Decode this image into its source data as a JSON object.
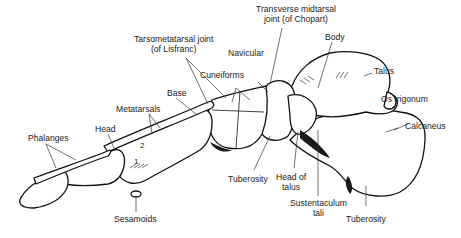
{
  "diagram": {
    "labels": {
      "transverse_midtarsal": "Transverse midtarsal",
      "transverse_midtarsal_2": "joint (of Chopart)",
      "body": "Body",
      "tarsometatarsal": "Tarsometatarsal joint",
      "tarsometatarsal_2": "(of Lisfranc)",
      "navicular": "Navicular",
      "talus": "Talus",
      "cuneiforms": "Cuneiforms",
      "base": "Base",
      "os_trigonum": "Os trigonum",
      "metatarsals": "Metatarsals",
      "calcaneus": "Calcaneus",
      "phalanges": "Phalanges",
      "head": "Head",
      "tuberosity_navicular": "Tuberosity",
      "head_of_talus": "Head of",
      "head_of_talus_2": "talus",
      "sustentaculum": "Sustentaculum",
      "sustentaculum_2": "tali",
      "sesamoids": "Sesamoids",
      "tuberosity_calcaneus": "Tuberosity"
    },
    "metatarsal_numbers": [
      "1",
      "2"
    ],
    "colors": {
      "line": "#111111",
      "text": "#222222",
      "background": "#ffffff"
    }
  }
}
